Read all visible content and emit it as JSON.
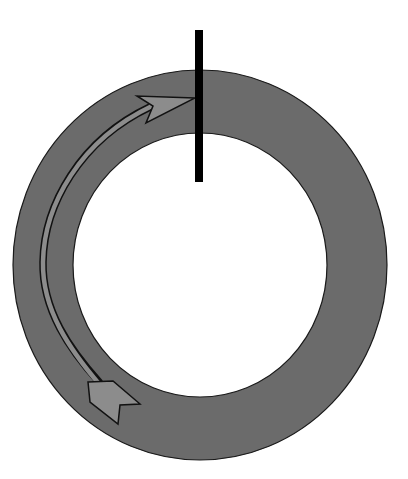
{
  "diagram": {
    "colors": {
      "background": "#ffffff",
      "ring_fill": "#6b6b6b",
      "ring_stroke": "#1a1a1a",
      "arrow_fill": "#8c8c8c",
      "arrow_stroke": "#111111",
      "marker_bar": "#000000"
    },
    "ring": {
      "cx": 200,
      "cy": 265,
      "outer_rx": 187,
      "outer_ry": 195,
      "inner_rx": 127,
      "inner_ry": 132
    },
    "marker_bar": {
      "x": 195,
      "y": 30,
      "width": 8,
      "height": 152
    },
    "arrow": {
      "direction": "clockwise-up toward marker bar",
      "head_tip": [
        195,
        98
      ],
      "tail_position": [
        115,
        403
      ]
    },
    "labels": []
  }
}
